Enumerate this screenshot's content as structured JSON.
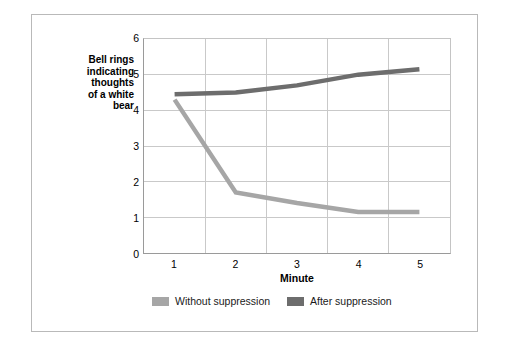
{
  "chart_data": {
    "type": "line",
    "title": "",
    "xlabel": "Minute",
    "ylabel": "Bell rings indicating thoughts of a white bear",
    "categories": [
      "1",
      "2",
      "3",
      "4",
      "5"
    ],
    "x": [
      1,
      2,
      3,
      4,
      5
    ],
    "ylim": [
      0,
      6
    ],
    "yticks": [
      0,
      1,
      2,
      3,
      4,
      5,
      6
    ],
    "ytick_labels": [
      "0",
      "1",
      "2",
      "3",
      "4",
      "5",
      "6"
    ],
    "xtick_labels": [
      "1",
      "2",
      "3",
      "4",
      "5"
    ],
    "grid": "horizontal-and-vertical",
    "legend_position": "bottom",
    "series": [
      {
        "name": "Without suppression",
        "color": "#a6a6a6",
        "values": [
          4.3,
          1.7,
          1.4,
          1.15,
          1.15
        ]
      },
      {
        "name": "After suppression",
        "color": "#6d6d6d",
        "values": [
          4.45,
          4.5,
          4.7,
          5.0,
          5.15
        ]
      }
    ]
  },
  "axis": {
    "y_title_lines": [
      "Bell rings",
      "indicating",
      "thoughts",
      "of a white",
      "bear"
    ],
    "y_title_text": "Bell rings indicating thoughts of a white bear",
    "x_title": "Minute"
  },
  "legend": {
    "items": [
      {
        "label": "Without suppression",
        "color": "#a6a6a6"
      },
      {
        "label": "After suppression",
        "color": "#6d6d6d"
      }
    ]
  },
  "colors": {
    "background": "#ffffff",
    "frame_border": "#b9b9b9",
    "axis_line": "#9a9a9a",
    "gridline": "#c9c9c9",
    "series_light": "#a6a6a6",
    "series_dark": "#6d6d6d",
    "text": "#000000"
  }
}
